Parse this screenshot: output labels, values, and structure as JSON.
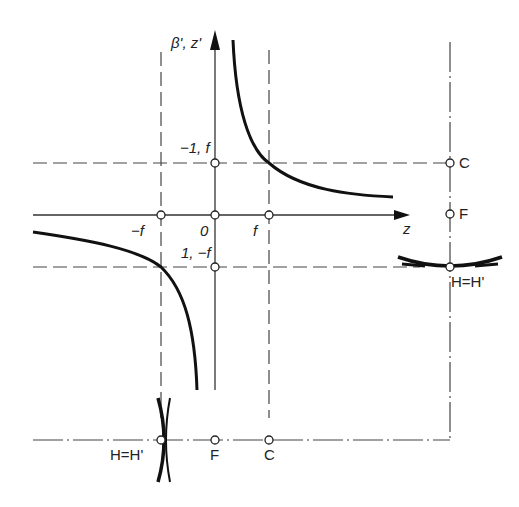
{
  "diagram": {
    "axes": {
      "y_label": "β', z'",
      "x_label": "z"
    },
    "axis_labels": {
      "origin": "0",
      "neg_f": "−f",
      "pos_f": "f",
      "upper": "−1, f",
      "lower": "1, −f"
    },
    "right_axis": {
      "c_label": "C",
      "f_label": "F",
      "vertex_label": "H=H'"
    },
    "bottom_axis": {
      "vertex_label": "H=H'",
      "f_label": "F",
      "c_label": "C"
    },
    "colors": {
      "line": "#333333",
      "curve": "#111111",
      "background": "#ffffff"
    }
  }
}
